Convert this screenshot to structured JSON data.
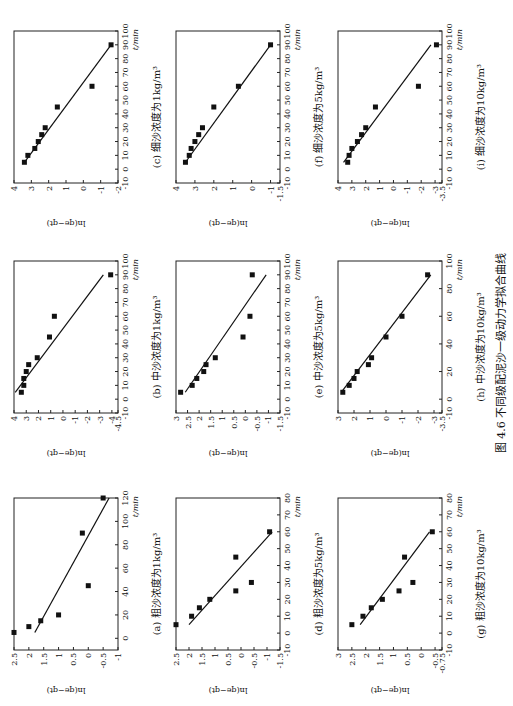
{
  "figure_title": "图 4.6  不同级配泥沙一级动力学拟合曲线",
  "chart_data": [
    {
      "id": "a",
      "type": "scatter",
      "title": "(a) 粗沙浓度为1kg/m³",
      "xlabel": "t/min",
      "ylabel": "ln(qe−qt)",
      "xlim": [
        -10,
        120
      ],
      "xticks": [
        0,
        20,
        40,
        60,
        80,
        100,
        120
      ],
      "ylim": [
        -1.0,
        2.5
      ],
      "yticks": [
        2.5,
        2.0,
        1.5,
        1.0,
        0.5,
        0,
        -0.5,
        -1.0
      ],
      "x": [
        5,
        10,
        15,
        20,
        45,
        90,
        120
      ],
      "y": [
        2.5,
        2.0,
        1.6,
        1.0,
        0.0,
        0.2,
        -0.5
      ],
      "fit": [
        [
          5,
          1.8
        ],
        [
          120,
          -0.7
        ]
      ]
    },
    {
      "id": "b",
      "type": "scatter",
      "title": "(b) 中沙浓度为1kg/m³",
      "xlabel": "t/min",
      "ylabel": "ln(qe−qt)",
      "xlim": [
        -10,
        100
      ],
      "xticks": [
        -10,
        0,
        10,
        20,
        30,
        40,
        50,
        60,
        70,
        80,
        90,
        100
      ],
      "ylim": [
        -4.5,
        4
      ],
      "yticks": [
        4,
        3,
        2,
        1,
        0,
        -1,
        -2,
        -3,
        -4,
        -4.5
      ],
      "x": [
        5,
        10,
        15,
        20,
        25,
        30,
        45,
        60,
        90
      ],
      "y": [
        3.4,
        3.2,
        3.2,
        3.0,
        2.8,
        2.1,
        1.1,
        0.7,
        -3.9
      ],
      "fit": [
        [
          5,
          3.9
        ],
        [
          90,
          -3.3
        ]
      ]
    },
    {
      "id": "c",
      "type": "scatter",
      "title": "(c) 细沙浓度为1kg/m³",
      "xlabel": "t/min",
      "ylabel": "ln(qe−qt)",
      "xlim": [
        -10,
        100
      ],
      "xticks": [
        -10,
        0,
        10,
        20,
        30,
        40,
        50,
        60,
        70,
        80,
        90,
        100
      ],
      "ylim": [
        -2,
        4
      ],
      "yticks": [
        4,
        3,
        2,
        1,
        0,
        -1,
        -2
      ],
      "x": [
        5,
        10,
        15,
        20,
        25,
        30,
        45,
        60,
        90
      ],
      "y": [
        3.4,
        3.2,
        2.8,
        2.6,
        2.4,
        2.2,
        1.5,
        -0.5,
        -1.6
      ],
      "fit": [
        [
          5,
          3.4
        ],
        [
          90,
          -1.6
        ]
      ]
    },
    {
      "id": "d",
      "type": "scatter",
      "title": "(d) 粗沙浓度为5kg/m³",
      "xlabel": "t/min",
      "ylabel": "ln(qe−qt)",
      "xlim": [
        -10,
        80
      ],
      "xticks": [
        -10,
        0,
        10,
        20,
        30,
        40,
        50,
        60,
        70,
        80
      ],
      "ylim": [
        -1.5,
        2.5
      ],
      "yticks": [
        2.5,
        2.0,
        1.5,
        1.0,
        0.5,
        0,
        -0.5,
        -1.0,
        -1.5
      ],
      "x": [
        5,
        10,
        15,
        20,
        25,
        30,
        45,
        60
      ],
      "y": [
        2.5,
        1.9,
        1.6,
        1.2,
        0.2,
        -0.4,
        0.2,
        -1.1
      ],
      "fit": [
        [
          5,
          2.0
        ],
        [
          60,
          -1.2
        ]
      ]
    },
    {
      "id": "e",
      "type": "scatter",
      "title": "(e) 中沙浓度为5kg/m³",
      "xlabel": "t/min",
      "ylabel": "ln(qe−qt)",
      "xlim": [
        -10,
        100
      ],
      "xticks": [
        -10,
        0,
        10,
        20,
        30,
        40,
        50,
        60,
        70,
        80,
        90,
        100
      ],
      "ylim": [
        -1.5,
        3.0
      ],
      "yticks": [
        3.0,
        2.5,
        2.0,
        1.5,
        1.0,
        0.5,
        0,
        -0.5,
        -1.0,
        -1.5
      ],
      "x": [
        5,
        10,
        15,
        20,
        25,
        30,
        45,
        60,
        90
      ],
      "y": [
        2.8,
        2.3,
        2.1,
        1.8,
        1.7,
        1.3,
        0.1,
        -0.2,
        -0.3
      ],
      "fit": [
        [
          5,
          2.6
        ],
        [
          90,
          -0.9
        ]
      ]
    },
    {
      "id": "f",
      "type": "scatter",
      "title": "(f) 细沙浓度为5kg/m³",
      "xlabel": "t/min",
      "ylabel": "ln(qe−qt)",
      "xlim": [
        -10,
        100
      ],
      "xticks": [
        -10,
        0,
        10,
        20,
        30,
        40,
        50,
        60,
        70,
        80,
        90,
        100
      ],
      "ylim": [
        -1.5,
        4
      ],
      "yticks": [
        4,
        3,
        2,
        1,
        0,
        -1,
        -1.5
      ],
      "x": [
        5,
        10,
        15,
        20,
        25,
        30,
        45,
        60,
        90
      ],
      "y": [
        3.5,
        3.3,
        3.2,
        3.0,
        2.8,
        2.6,
        2.0,
        0.7,
        -1.0
      ],
      "fit": [
        [
          5,
          3.5
        ],
        [
          90,
          -1.0
        ]
      ]
    },
    {
      "id": "g",
      "type": "scatter",
      "title": "(g) 粗沙浓度为10kg/m³",
      "xlabel": "t/min",
      "ylabel": "ln(qe−qt)",
      "xlim": [
        -10,
        80
      ],
      "xticks": [
        -10,
        0,
        10,
        20,
        30,
        40,
        50,
        60,
        70,
        80
      ],
      "ylim": [
        -0.75,
        3.0
      ],
      "yticks": [
        3.0,
        2.5,
        2.0,
        1.5,
        1.0,
        0.5,
        0,
        -0.5,
        -0.75
      ],
      "x": [
        5,
        10,
        15,
        20,
        25,
        30,
        45,
        60
      ],
      "y": [
        2.5,
        2.1,
        1.8,
        1.4,
        0.8,
        0.3,
        0.6,
        -0.4
      ],
      "fit": [
        [
          5,
          2.2
        ],
        [
          60,
          -0.3
        ]
      ]
    },
    {
      "id": "h",
      "type": "scatter",
      "title": "(h) 中沙浓度为10kg/m³",
      "xlabel": "t/min",
      "ylabel": "ln(qe−qt)",
      "xlim": [
        -10,
        100
      ],
      "xticks": [
        -10,
        0,
        20,
        40,
        60,
        80,
        100
      ],
      "ylim": [
        -3.5,
        3
      ],
      "yticks": [
        3,
        2,
        1,
        0,
        -1,
        -2,
        -3,
        -3.5
      ],
      "x": [
        5,
        10,
        15,
        20,
        25,
        30,
        45,
        60,
        90
      ],
      "y": [
        2.7,
        2.3,
        2.0,
        1.8,
        1.1,
        0.9,
        0.0,
        -1.0,
        -2.6
      ],
      "fit": [
        [
          5,
          2.8
        ],
        [
          90,
          -2.8
        ]
      ]
    },
    {
      "id": "i",
      "type": "scatter",
      "title": "(i) 细沙浓度为10kg/m³",
      "xlabel": "t/min",
      "ylabel": "ln(qe−qt)",
      "xlim": [
        -10,
        100
      ],
      "xticks": [
        -10,
        0,
        10,
        20,
        30,
        40,
        50,
        60,
        70,
        80,
        90,
        100
      ],
      "ylim": [
        -3.5,
        4
      ],
      "yticks": [
        4,
        3,
        2,
        1,
        0,
        -1,
        -2,
        -3,
        -3.5
      ],
      "x": [
        5,
        10,
        15,
        20,
        25,
        30,
        45,
        60,
        90
      ],
      "y": [
        3.3,
        3.2,
        3.0,
        2.6,
        2.3,
        2.0,
        1.3,
        -1.8,
        -3.1
      ],
      "fit": [
        [
          5,
          3.6
        ],
        [
          90,
          -2.7
        ]
      ]
    }
  ]
}
